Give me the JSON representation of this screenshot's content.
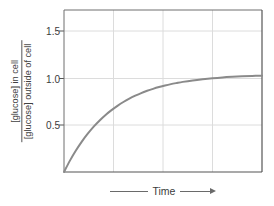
{
  "chart_data": {
    "type": "line",
    "title": "",
    "subtitle": "",
    "xlabel": "Time",
    "ylabel_numerator": "[glucose] in cell",
    "ylabel_denominator": "[glucose] outside of cell",
    "ylabel": "[glucose] in cell / [glucose] outside of cell",
    "ylim": [
      0,
      1.65
    ],
    "xlim": [
      0,
      1
    ],
    "yticks": [
      0.5,
      1.0,
      1.5
    ],
    "ytick_labels": [
      "0.5",
      "1.0",
      "1.5"
    ],
    "xticks": [],
    "xtick_labels": [],
    "grid": true,
    "grid_horizontal_count": 3,
    "grid_vertical_count": 3,
    "legend": "none",
    "annotations": [],
    "series": [
      {
        "name": "glucose ratio",
        "color": "#8a8a8a",
        "asymptote": 1.0,
        "x": [
          0.0,
          0.03,
          0.06,
          0.09,
          0.12,
          0.15,
          0.18,
          0.21,
          0.24,
          0.27,
          0.3,
          0.33,
          0.36,
          0.39,
          0.42,
          0.45,
          0.48,
          0.51,
          0.54,
          0.57,
          0.6,
          0.65,
          0.7,
          0.75,
          0.8,
          0.85,
          0.9,
          0.95,
          1.0
        ],
        "values": [
          0.0,
          0.116,
          0.219,
          0.31,
          0.39,
          0.462,
          0.525,
          0.581,
          0.63,
          0.674,
          0.713,
          0.747,
          0.777,
          0.804,
          0.827,
          0.847,
          0.865,
          0.881,
          0.895,
          0.907,
          0.918,
          0.933,
          0.945,
          0.955,
          0.963,
          0.969,
          0.974,
          0.978,
          0.981
        ]
      }
    ]
  },
  "axis": {
    "x_arrow_label": "Time",
    "x_left_rule": "line-segment",
    "x_right_arrow": "arrow-right-icon"
  },
  "colors": {
    "curve": "#8a8a8a",
    "grid": "#dcdcdc",
    "border": "#555555",
    "text": "#3b3b3b",
    "background": "#ffffff"
  }
}
